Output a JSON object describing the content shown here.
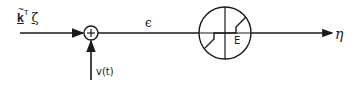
{
  "diagram": {
    "type": "block-diagram",
    "colors": {
      "stroke": "#1a1a1a",
      "background": "#ffffff"
    },
    "input": {
      "k_symbol": "k",
      "tilde": "~",
      "superscript": "T",
      "vector": "ζ"
    },
    "summing_junction": {
      "symbol": "+"
    },
    "disturbance": {
      "label": "v(t)"
    },
    "error_signal": {
      "label": "ϵ"
    },
    "nonlinearity": {
      "label": "E"
    },
    "output": {
      "label": "η"
    }
  }
}
